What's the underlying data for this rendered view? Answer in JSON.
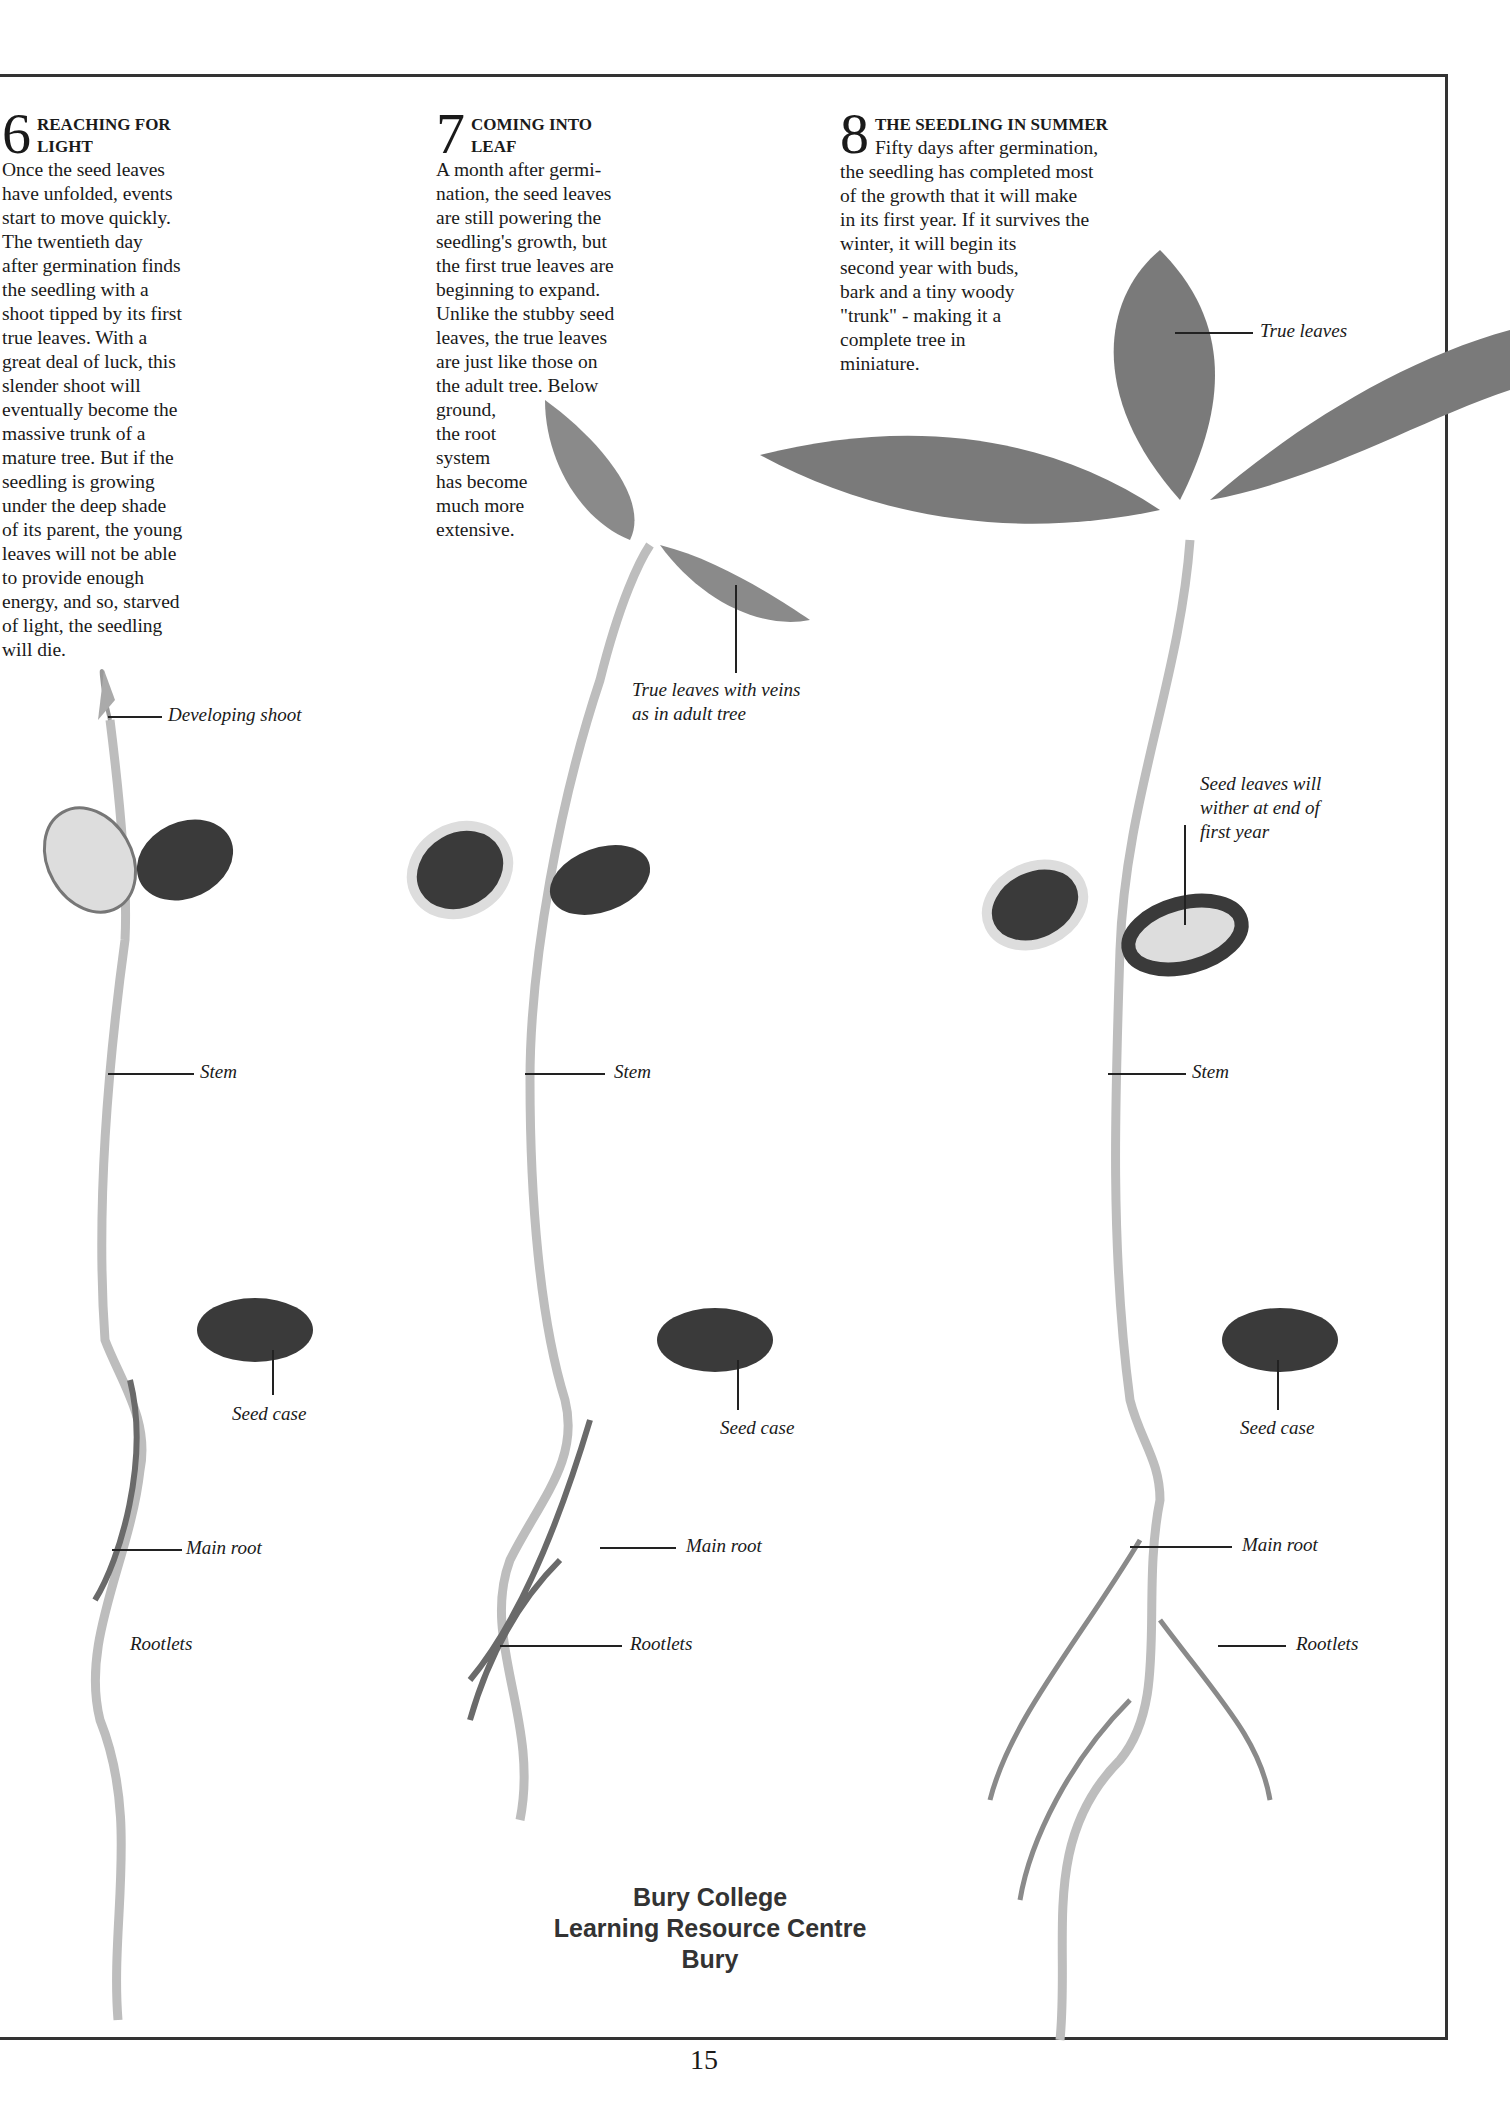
{
  "page": {
    "number": "15"
  },
  "sections": [
    {
      "number": "6",
      "title_lines": [
        "REACHING FOR",
        "LIGHT"
      ],
      "body_lines": [
        "Once the seed leaves",
        "have unfolded, events",
        "start to move quickly.",
        "The twentieth day",
        "after germination finds",
        "the seedling with a",
        "shoot tipped by its first",
        "true leaves. With a",
        "great deal of luck, this",
        "slender shoot will",
        "eventually become the",
        "massive trunk of a",
        "mature tree. But if the",
        "seedling is growing",
        "under the deep shade",
        "of its parent, the young",
        "leaves will not be able",
        "to provide enough",
        "energy, and so, starved",
        "of light, the seedling",
        "will  die."
      ]
    },
    {
      "number": "7",
      "title_lines": [
        "COMING INTO",
        "LEAF"
      ],
      "body_lines": [
        "A month after germi-",
        "nation, the seed leaves",
        "are still powering the",
        "seedling's growth, but",
        "the first true leaves are",
        "beginning to expand.",
        "Unlike the stubby seed",
        "leaves, the true leaves",
        "are just like those on",
        "the adult tree. Below",
        "ground,",
        "the root",
        "system",
        "has become",
        "much more",
        "extensive."
      ]
    },
    {
      "number": "8",
      "title_lines": [
        "THE SEEDLING IN SUMMER"
      ],
      "first_line": "Fifty days after germination,",
      "body_lines": [
        "the seedling has completed most",
        "of the growth that it will make",
        "in its first year. If it survives the",
        "winter, it will begin its",
        "second year with buds,",
        "bark and a tiny woody",
        "\"trunk\" - making it a",
        "complete tree in",
        "miniature."
      ]
    }
  ],
  "labels": {
    "developing_shoot": "Developing  shoot",
    "true_leaves_veins_1": "True  leaves  with  veins",
    "true_leaves_veins_2": "as  in  adult  tree",
    "true_leaves": "True  leaves",
    "seed_leaves_1": "Seed  leaves  will",
    "seed_leaves_2": "wither  at  end  of",
    "seed_leaves_3": "first  year",
    "stem": "Stem",
    "seed_case": "Seed  case",
    "main_root": "Main root",
    "rootlets": "Rootlets"
  },
  "stamp": {
    "lines": [
      "Bury College",
      "Learning Resource Centre",
      "Bury"
    ]
  },
  "colors": {
    "ink": "#1a1a1a",
    "rule": "#333333",
    "leaf": "#7a7a7a",
    "seed_leaf_dark": "#3a3a3a",
    "stem": "#bdbdbd"
  }
}
